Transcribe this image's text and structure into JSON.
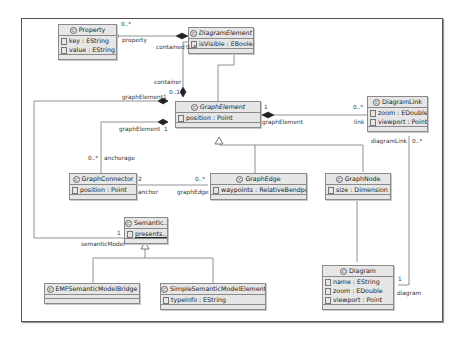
{
  "diagram": {
    "type": "UML class diagram",
    "classes": {
      "property": {
        "name": "Property",
        "abstract": false,
        "attributes": [
          "key : EString",
          "value : EString"
        ]
      },
      "diagram_element": {
        "name": "DiagramElement",
        "abstract": true,
        "attributes": [
          "isVisible : EBoolean"
        ]
      },
      "graph_element": {
        "name": "GraphElement",
        "abstract": true,
        "attributes": [
          "position : Point"
        ]
      },
      "diagram_link": {
        "name": "DiagramLink",
        "abstract": false,
        "attributes": [
          "zoom : EDouble",
          "viewport : Point"
        ]
      },
      "graph_connector": {
        "name": "GraphConnector",
        "abstract": false,
        "attributes": [
          "position : Point"
        ]
      },
      "graph_edge": {
        "name": "GraphEdge",
        "abstract": false,
        "attributes": [
          "waypoints : RelativeBendpoint"
        ]
      },
      "graph_node": {
        "name": "GraphNode",
        "abstract": false,
        "attributes": [
          "size : Dimension"
        ]
      },
      "semantic": {
        "name": "Semantic...",
        "abstract": false,
        "attributes": [
          "presents..."
        ]
      },
      "emf_bridge": {
        "name": "EMFSemanticModelBridge",
        "abstract": false,
        "attributes": []
      },
      "simple_semantic": {
        "name": "SimpleSemanticModelElement",
        "abstract": false,
        "attributes": [
          "typeInfo : EString"
        ]
      },
      "diagram": {
        "name": "Diagram",
        "abstract": false,
        "attributes": [
          "name : EString",
          "zoom : EDouble",
          "viewport : Point"
        ]
      }
    },
    "labels": {
      "property_mult": "0..*",
      "property_role": "property",
      "contained_role": "contained",
      "contained_mult": "0..*",
      "container_role": "container",
      "container_mult": "0..1",
      "ge_sem_role": "graphElement",
      "ge_sem_mult": "1",
      "ge_conn_role": "graphElement",
      "ge_conn_mult": "1",
      "anchorage_mult": "0..*",
      "anchorage_role": "anchorage",
      "anchor_mult": "2",
      "anchor_role": "anchor",
      "graphedge_mult": "0..*",
      "graphedge_role": "graphEdge",
      "ge_link_mult": "1",
      "ge_link_role": "graphElement",
      "link_mult": "0..*",
      "link_role": "link",
      "diagramlink_role": "diagramLink",
      "diagramlink_mult": "0..*",
      "diagram_mult": "1",
      "diagram_role": "diagram",
      "semantic_mult": "1",
      "semantic_role": "semanticModel"
    }
  }
}
